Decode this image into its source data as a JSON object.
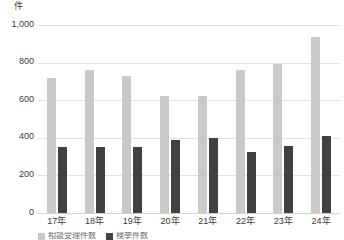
{
  "unit_label": "件",
  "chart_data": {
    "type": "bar",
    "title": "",
    "xlabel": "",
    "ylabel": "件",
    "ylim": [
      0,
      1000
    ],
    "yticks": [
      0,
      200,
      400,
      600,
      800,
      1000
    ],
    "ytick_labels": [
      "0",
      "200",
      "400",
      "600",
      "800",
      "1,000"
    ],
    "grid": true,
    "legend_position": "bottom",
    "categories": [
      "17年",
      "18年",
      "19年",
      "20年",
      "21年",
      "22年",
      "23年",
      "24年"
    ],
    "series": [
      {
        "name": "相談受理件数",
        "color": "#c9c9c9",
        "values": [
          720,
          760,
          730,
          625,
          625,
          760,
          790,
          935
        ]
      },
      {
        "name": "検挙件数",
        "color": "#414141",
        "values": [
          350,
          350,
          350,
          390,
          400,
          325,
          355,
          410
        ]
      }
    ]
  }
}
